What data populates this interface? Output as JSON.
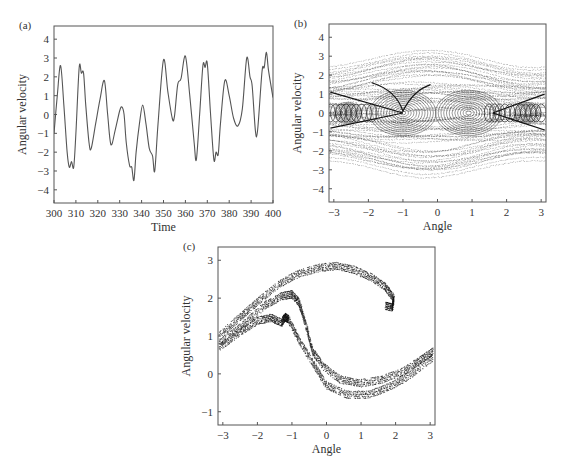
{
  "chart_data": [
    {
      "id": "a",
      "panel_label": "(a)",
      "type": "line",
      "title": "",
      "xlabel": "Time",
      "ylabel": "Angular velocity",
      "xlim": [
        300,
        400
      ],
      "ylim": [
        -4.7,
        4.7
      ],
      "xticks": [
        300,
        310,
        320,
        330,
        340,
        350,
        360,
        370,
        380,
        390,
        400
      ],
      "yticks": [
        -4,
        -3,
        -2,
        -1,
        0,
        1,
        2,
        3,
        4
      ],
      "grid": false,
      "series": [
        {
          "name": "angular velocity",
          "x": [
            300,
            301.5,
            303,
            304.5,
            306,
            307,
            308,
            309,
            310,
            311.5,
            312.5,
            313.5,
            314.5,
            316,
            317,
            319,
            321,
            323,
            324.5,
            326,
            328,
            330,
            331,
            332,
            333,
            334.5,
            335.5,
            336.5,
            337.5,
            339,
            340.5,
            342,
            343.5,
            345,
            346,
            347.5,
            350,
            352,
            354,
            355,
            356.5,
            358,
            360,
            362,
            364,
            365,
            366.5,
            368,
            369,
            370,
            371.5,
            373,
            374,
            375,
            376,
            378,
            380,
            382,
            384,
            386,
            388,
            389.5,
            390.5,
            392,
            393,
            395,
            396,
            397,
            398,
            400
          ],
          "y": [
            -1.0,
            1.0,
            2.6,
            0.5,
            -2.0,
            -2.8,
            -2.5,
            -2.8,
            -1.0,
            2.5,
            2.2,
            2.2,
            0.5,
            -1.5,
            -1.8,
            -0.5,
            0.8,
            1.8,
            0.0,
            -1.6,
            -0.8,
            0.2,
            0.4,
            0.0,
            -1.5,
            -2.7,
            -2.8,
            -3.5,
            -2.0,
            -0.5,
            0.5,
            -0.5,
            -1.8,
            -2.2,
            -3.0,
            -0.5,
            2.9,
            1.2,
            -0.2,
            -0.1,
            1.6,
            1.9,
            3.1,
            1.0,
            -1.5,
            -2.4,
            0.0,
            2.6,
            2.5,
            2.7,
            0.0,
            -2.4,
            -2.0,
            -2.1,
            -0.5,
            1.8,
            1.0,
            -0.2,
            -0.6,
            0.3,
            3.0,
            2.0,
            1.5,
            -0.9,
            -0.8,
            2.3,
            2.5,
            3.3,
            2.3,
            0.9
          ]
        }
      ]
    },
    {
      "id": "b",
      "panel_label": "(b)",
      "type": "scatter",
      "title": "",
      "xlabel": "Angle",
      "ylabel": "Angular velocity",
      "xlim": [
        -3.14,
        3.14
      ],
      "ylim": [
        -4.7,
        4.7
      ],
      "xticks": [
        -3,
        -2,
        -1,
        0,
        1,
        2,
        3
      ],
      "yticks": [
        -4,
        -3,
        -2,
        -1,
        0,
        1,
        2,
        3,
        4
      ],
      "grid": false,
      "description": "Dense phase-space trajectory filling band |v| <~ 3.5; spiral centers near (-1, 0) and (1, 0); chain of loops along v=0 near x=±2.5",
      "envelope": {
        "upper": 3.4,
        "lower": -3.4,
        "edge_upper": 2.8,
        "edge_lower": -2.8
      },
      "spiral_centers": [
        [
          -1.0,
          0.0
        ],
        [
          0.9,
          0.0
        ],
        [
          -2.6,
          0.0
        ],
        [
          2.6,
          0.0
        ]
      ]
    },
    {
      "id": "c",
      "panel_label": "(c)",
      "type": "scatter",
      "title": "",
      "xlabel": "Angle",
      "ylabel": "Angular velocity",
      "xlim": [
        -3.14,
        3.14
      ],
      "ylim": [
        -1.35,
        3.35
      ],
      "xticks": [
        -3,
        -2,
        -1,
        0,
        1,
        2,
        3
      ],
      "yticks": [
        -1,
        0,
        1,
        2,
        3
      ],
      "grid": false,
      "description": "Poincare section: strange attractor with folded bands",
      "series": [
        {
          "name": "upper arc",
          "x": [
            -3.1,
            -2.5,
            -2.0,
            -1.4,
            -0.8,
            -0.2,
            0.3,
            0.8,
            1.3,
            1.7,
            1.95,
            1.9,
            1.7
          ],
          "y": [
            1.0,
            1.5,
            1.9,
            2.35,
            2.65,
            2.8,
            2.85,
            2.75,
            2.55,
            2.3,
            2.0,
            1.75,
            1.8
          ]
        },
        {
          "name": "middle fold",
          "x": [
            -3.1,
            -2.4,
            -1.8,
            -1.3,
            -1.0,
            -0.8,
            -0.6,
            -0.4,
            -0.1,
            0.4,
            1.0,
            1.6,
            2.2,
            2.7,
            3.1
          ],
          "y": [
            0.8,
            1.3,
            1.8,
            2.05,
            2.1,
            1.9,
            1.3,
            0.6,
            0.2,
            -0.15,
            -0.25,
            -0.15,
            0.05,
            0.35,
            0.6
          ]
        },
        {
          "name": "lower fold",
          "x": [
            -3.1,
            -2.5,
            -2.0,
            -1.6,
            -1.3,
            -1.2,
            -1.1,
            -0.8,
            -0.4,
            0.0,
            0.6,
            1.2,
            1.8,
            2.4,
            3.1
          ],
          "y": [
            0.7,
            1.1,
            1.4,
            1.48,
            1.35,
            1.5,
            1.45,
            0.9,
            0.3,
            -0.3,
            -0.55,
            -0.55,
            -0.35,
            -0.05,
            0.45
          ]
        }
      ]
    }
  ]
}
